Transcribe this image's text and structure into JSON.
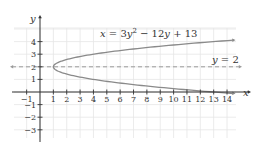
{
  "chart_data": {
    "type": "line",
    "title": "",
    "xlabel": "x",
    "ylabel": "y",
    "xlim": [
      -1.9,
      14.6
    ],
    "ylim": [
      -3.6,
      5.0
    ],
    "grid": true,
    "x_ticks": [
      -1,
      1,
      2,
      3,
      4,
      5,
      6,
      7,
      8,
      9,
      10,
      11,
      12,
      13,
      14
    ],
    "y_ticks": [
      4,
      3,
      2,
      1,
      -1,
      -2,
      -3
    ],
    "series": [
      {
        "name": "x = 3y^2 - 12y + 13",
        "kind": "parabola_x_of_y",
        "coefficients": {
          "a": 3,
          "b": -12,
          "c": 13
        },
        "y_range": [
          -0.12,
          4.12
        ],
        "vertex": [
          1,
          2
        ],
        "style": "solid",
        "arrows": "both"
      },
      {
        "name": "y = 2",
        "kind": "horizontal_line",
        "y": 2,
        "style": "dashed",
        "arrows": "both"
      }
    ],
    "annotations": [
      {
        "text_parts": [
          "x",
          " = 3",
          "y",
          "2",
          " − 12",
          "y",
          " + 13"
        ],
        "at": [
          6.0,
          4.5
        ]
      },
      {
        "text_parts": [
          "y",
          " = 2"
        ],
        "at": [
          13.4,
          2.3
        ]
      }
    ],
    "colors": {
      "curve": "#8a8a8a",
      "axis": "#333333",
      "grid": "#e6e6e6",
      "dashed": "#9a9a9a",
      "text": "#333333"
    }
  },
  "labels": {
    "x_axis": "x",
    "y_axis": "y",
    "equation": {
      "x": "x",
      "eq": " = 3",
      "y": "y",
      "sup": "2",
      "mid": " − 12",
      "y2": "y",
      "tail": " + 13"
    },
    "asymptote": {
      "y": "y",
      "rest": " = 2"
    }
  }
}
